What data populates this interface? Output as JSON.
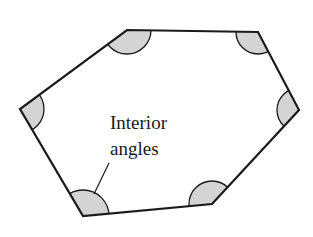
{
  "diagram": {
    "type": "hexagon-interior-angles",
    "label_line1": "Interior",
    "label_line2": "angles",
    "colors": {
      "stroke": "#1a1a1a",
      "angle_fill": "#d4d4d4",
      "background": "#ffffff"
    },
    "vertices": [
      {
        "name": "top-left",
        "x": 127,
        "y": 30
      },
      {
        "name": "top-right",
        "x": 258,
        "y": 32
      },
      {
        "name": "right",
        "x": 299,
        "y": 110
      },
      {
        "name": "bottom-right",
        "x": 212,
        "y": 204
      },
      {
        "name": "bottom-left",
        "x": 83,
        "y": 216
      },
      {
        "name": "left",
        "x": 20,
        "y": 109
      }
    ]
  }
}
